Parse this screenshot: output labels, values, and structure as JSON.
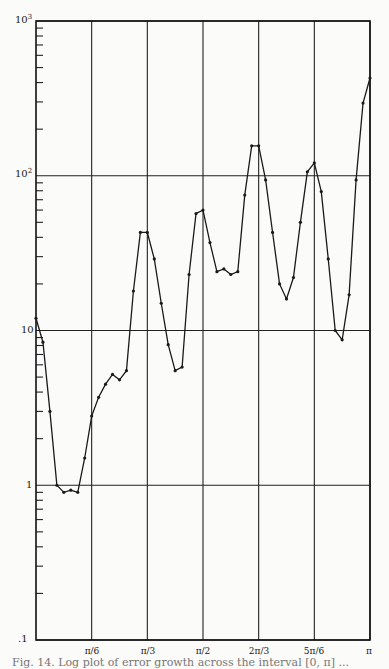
{
  "chart_data": {
    "type": "line",
    "title": "",
    "xlabel": "",
    "ylabel": "",
    "yscale": "log",
    "ylim": [
      0.1,
      1000
    ],
    "xlim": [
      0,
      3.1416
    ],
    "grid": true,
    "legend": null,
    "x_tick_labels": [
      "π/6",
      "π/3",
      "π/2",
      "2π/3",
      "5π/6",
      "π"
    ],
    "x_tick_values": [
      0.5236,
      1.0472,
      1.5708,
      2.0944,
      2.618,
      3.1416
    ],
    "y_tick_labels": [
      ".1",
      "1",
      "10",
      "10²",
      "10³"
    ],
    "y_tick_values": [
      0.1,
      1,
      10,
      100,
      1000
    ],
    "series": [
      {
        "name": "curve",
        "marker": "dot",
        "x": [
          0.0,
          0.0654,
          0.1309,
          0.1963,
          0.2618,
          0.3272,
          0.3927,
          0.4581,
          0.5236,
          0.589,
          0.6545,
          0.7199,
          0.7854,
          0.8508,
          0.9163,
          0.9817,
          1.0472,
          1.1126,
          1.1781,
          1.2435,
          1.309,
          1.3744,
          1.4399,
          1.5053,
          1.5708,
          1.6362,
          1.7017,
          1.7671,
          1.8326,
          1.898,
          1.9635,
          2.0289,
          2.0944,
          2.1598,
          2.2253,
          2.2907,
          2.3562,
          2.4216,
          2.4871,
          2.5525,
          2.618,
          2.6834,
          2.7489,
          2.8143,
          2.8798,
          2.9452,
          3.0107,
          3.0761,
          3.1416
        ],
        "values": [
          12,
          8.4,
          3.0,
          1.0,
          0.9,
          0.93,
          0.9,
          1.5,
          2.8,
          3.7,
          4.5,
          5.2,
          4.8,
          5.5,
          18,
          43,
          43,
          29,
          15,
          8.1,
          5.5,
          5.8,
          23,
          57,
          60,
          37,
          24,
          25,
          23,
          24,
          75,
          156,
          156,
          94,
          43,
          20,
          16,
          22,
          50,
          106,
          121,
          79,
          29,
          10,
          8.7,
          17,
          94,
          295,
          428
        ]
      }
    ]
  },
  "axes": {
    "y_labels": [
      ".1",
      "1",
      "10",
      "10",
      "10"
    ],
    "y_label_exps": [
      "",
      "",
      "",
      "2",
      "3"
    ],
    "x_labels": [
      "π/6",
      "π/3",
      "π/2",
      "2π/3",
      "5π/6",
      "π"
    ]
  },
  "caption": "Fig. 14. Log plot of error growth across the interval [0, π] ..."
}
